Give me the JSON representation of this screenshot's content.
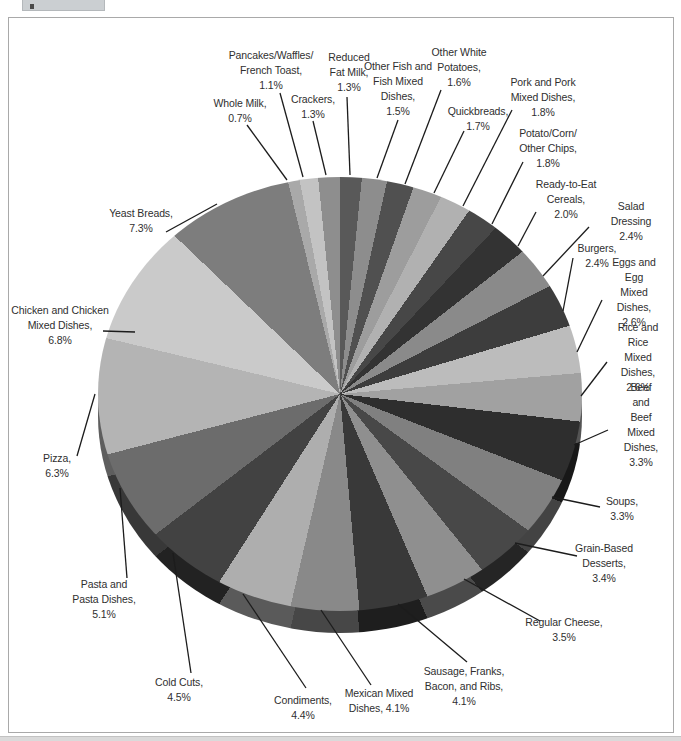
{
  "page": {
    "title": "",
    "background": "#ffffff",
    "frame_border_color": "#a9a9a9",
    "tab_color": "#cbcfd2",
    "bottom_strip_color": "#dadada",
    "label_text_color": "#2f2f2f",
    "leader_line_color": "#1c1c1c"
  },
  "chart_data": {
    "type": "pie",
    "style": "3d-grayscale",
    "title": "",
    "unit": "percent of intake",
    "displayed_total_percent": 80.9,
    "normalized_to_full_circle": true,
    "start_angle_deg": 0,
    "direction": "clockwise",
    "geometry": {
      "cx": 340,
      "cy": 394,
      "rx": 242,
      "ry": 217,
      "depth": 22
    },
    "segments": [
      {
        "label": "Reduced Fat Milk",
        "value": 1.3,
        "color": "#595959",
        "lines": [
          "Reduced",
          "Fat Milk,",
          "1.3%"
        ],
        "label_x": 349,
        "label_y": 72,
        "line": [
          347,
          97,
          350,
          175
        ]
      },
      {
        "label": "Other Fish and Fish Mixed Dishes",
        "value": 1.5,
        "color": "#8d8d8d",
        "lines": [
          "Other Fish and",
          "Fish Mixed",
          "Dishes,",
          "1.5%"
        ],
        "label_x": 398,
        "label_y": 89,
        "line": [
          398,
          120,
          377,
          178
        ]
      },
      {
        "label": "Other White Potatoes",
        "value": 1.6,
        "color": "#505050",
        "lines": [
          "Other White",
          "Potatoes,",
          "1.6%"
        ],
        "label_x": 459,
        "label_y": 67,
        "line": [
          441,
          90,
          405,
          184
        ]
      },
      {
        "label": "Quickbreads",
        "value": 1.7,
        "color": "#9d9d9d",
        "lines": [
          "Quickbreads,",
          "1.7%"
        ],
        "label_x": 478,
        "label_y": 119,
        "line": [
          464,
          131,
          434,
          193
        ]
      },
      {
        "label": "Pork and Pork Mixed Dishes",
        "value": 1.8,
        "color": "#b1b1b1",
        "lines": [
          "Pork and Pork",
          "Mixed Dishes,",
          "1.8%"
        ],
        "label_x": 543,
        "label_y": 97,
        "line": [
          512,
          110,
          463,
          206
        ]
      },
      {
        "label": "Potato/Corn/Other Chips",
        "value": 1.8,
        "color": "#474747",
        "lines": [
          "Potato/Corn/",
          "Other Chips,",
          "1.8%"
        ],
        "label_x": 548,
        "label_y": 148,
        "line": [
          523,
          162,
          492,
          224
        ]
      },
      {
        "label": "Ready-to-Eat Cereals",
        "value": 2.0,
        "color": "#333333",
        "lines": [
          "Ready-to-Eat",
          "Cereals,",
          "2.0%"
        ],
        "label_x": 566,
        "label_y": 199,
        "line": [
          536,
          212,
          518,
          246
        ]
      },
      {
        "label": "Salad Dressing",
        "value": 2.4,
        "color": "#8a8a8a",
        "lines": [
          "Salad Dressing",
          "2.4%"
        ],
        "label_x": 631,
        "label_y": 221,
        "line": [
          589,
          227,
          543,
          276
        ]
      },
      {
        "label": "Burgers",
        "value": 2.4,
        "color": "#3d3d3d",
        "lines": [
          "Burgers,",
          "2.4%"
        ],
        "label_x": 597,
        "label_y": 256,
        "line": [
          573,
          258,
          563,
          311
        ]
      },
      {
        "label": "Eggs and Egg Mixed Dishes",
        "value": 2.6,
        "color": "#bcbcbc",
        "lines": [
          "Eggs and Egg",
          "Mixed Dishes,",
          "2.6%"
        ],
        "label_x": 634,
        "label_y": 292,
        "line": [
          602,
          300,
          577,
          352
        ]
      },
      {
        "label": "Rice and Rice Mixed Dishes",
        "value": 2.6,
        "color": "#a1a1a1",
        "lines": [
          "Rice and Rice",
          "Mixed Dishes,",
          "2.6%"
        ],
        "label_x": 638,
        "label_y": 357,
        "line": [
          607,
          362,
          581,
          396
        ]
      },
      {
        "label": "Beef and Beef Mixed Dishes",
        "value": 3.3,
        "color": "#2e2e2e",
        "lines": [
          "Beef and Beef",
          "Mixed Dishes,",
          "3.3%"
        ],
        "label_x": 641,
        "label_y": 425,
        "line": [
          608,
          430,
          574,
          445
        ]
      },
      {
        "label": "Soups",
        "value": 3.3,
        "color": "#808080",
        "lines": [
          "Soups,",
          "3.3%"
        ],
        "label_x": 622,
        "label_y": 509,
        "line": [
          600,
          507,
          552,
          497
        ]
      },
      {
        "label": "Grain-Based Desserts",
        "value": 3.4,
        "color": "#484848",
        "lines": [
          "Grain-Based",
          "Desserts,",
          "3.4%"
        ],
        "label_x": 604,
        "label_y": 563,
        "line": [
          577,
          556,
          515,
          543
        ]
      },
      {
        "label": "Regular Cheese",
        "value": 3.5,
        "color": "#8f8f8f",
        "lines": [
          "Regular Cheese,",
          "3.5%"
        ],
        "label_x": 564,
        "label_y": 630,
        "line": [
          540,
          621,
          464,
          579
        ]
      },
      {
        "label": "Sausage, Franks, Bacon, and Ribs",
        "value": 4.1,
        "color": "#393939",
        "lines": [
          "Sausage, Franks,",
          "Bacon, and Ribs,",
          "4.1%"
        ],
        "label_x": 464,
        "label_y": 686,
        "line": [
          467,
          662,
          398,
          604
        ]
      },
      {
        "label": "Mexican Mixed Dishes",
        "value": 4.1,
        "color": "#898989",
        "lines": [
          "Mexican Mixed",
          "Dishes, 4.1%"
        ],
        "label_x": 379,
        "label_y": 701,
        "line": [
          371,
          685,
          321,
          610
        ]
      },
      {
        "label": "Condiments",
        "value": 4.4,
        "color": "#aeaeae",
        "lines": [
          "Condiments,",
          "4.4%"
        ],
        "label_x": 303,
        "label_y": 708,
        "line": [
          306,
          688,
          243,
          594
        ]
      },
      {
        "label": "Cold Cuts",
        "value": 4.5,
        "color": "#424242",
        "lines": [
          "Cold Cuts,",
          "4.5%"
        ],
        "label_x": 179,
        "label_y": 690,
        "line": [
          191,
          673,
          173,
          553
        ]
      },
      {
        "label": "Pasta and Pasta Dishes",
        "value": 5.1,
        "color": "#6c6c6c",
        "lines": [
          "Pasta and",
          "Pasta Dishes,",
          "5.1%"
        ],
        "label_x": 104,
        "label_y": 599,
        "line": [
          127,
          578,
          120,
          488
        ]
      },
      {
        "label": "Pizza",
        "value": 6.3,
        "color": "#b4b4b4",
        "lines": [
          "Pizza,",
          "6.3%"
        ],
        "label_x": 57,
        "label_y": 466,
        "line": [
          77,
          456,
          95,
          394
        ]
      },
      {
        "label": "Chicken and Chicken Mixed Dishes",
        "value": 6.8,
        "color": "#cacaca",
        "lines": [
          "Chicken and Chicken",
          "Mixed Dishes,",
          "6.8%"
        ],
        "label_x": 60,
        "label_y": 325,
        "line": [
          103,
          331,
          135,
          332
        ]
      },
      {
        "label": "Yeast Breads",
        "value": 7.3,
        "color": "#7d7d7d",
        "lines": [
          "Yeast Breads,",
          "7.3%"
        ],
        "label_x": 141,
        "label_y": 221,
        "line": [
          166,
          232,
          217,
          204
        ]
      },
      {
        "label": "Whole Milk",
        "value": 0.7,
        "color": "#a9a9a9",
        "lines": [
          "Whole Milk,",
          "0.7%"
        ],
        "label_x": 240,
        "label_y": 111,
        "line": [
          247,
          125,
          287,
          180
        ]
      },
      {
        "label": "Pancakes/Waffles/French Toast",
        "value": 1.1,
        "color": "#c3c3c3",
        "lines": [
          "Pancakes/Waffles/",
          "French Toast,",
          "1.1%"
        ],
        "label_x": 271,
        "label_y": 70,
        "line": [
          280,
          93,
          303,
          177
        ]
      },
      {
        "label": "Crackers",
        "value": 1.3,
        "color": "#8e8e8e",
        "lines": [
          "Crackers,",
          "1.3%"
        ],
        "label_x": 313,
        "label_y": 107,
        "line": [
          313,
          121,
          326,
          175
        ]
      }
    ]
  }
}
